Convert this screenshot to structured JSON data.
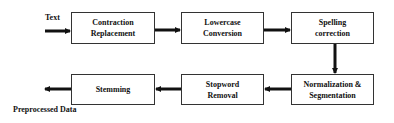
{
  "diagram": {
    "input_label": "Text",
    "output_label": "Preprocessed Data",
    "steps": [
      {
        "label": "Contraction Replacement",
        "line1": "Contraction",
        "line2": "Replacement"
      },
      {
        "label": "Lowercase Conversion",
        "line1": "Lowercase",
        "line2": "Conversion"
      },
      {
        "label": "Spelling correction",
        "line1": "Spelling",
        "line2": "correction"
      },
      {
        "label": "Normalization & Segmentation",
        "line1": "Normalization &",
        "line2": "Segmentation"
      },
      {
        "label": "Stopword Removal",
        "line1": "Stopword",
        "line2": "Removal"
      },
      {
        "label": "Stemming",
        "line1": "Stemming",
        "line2": ""
      }
    ],
    "colors": {
      "stroke": "#333333",
      "arrow": "#111111",
      "background": "#ffffff"
    }
  }
}
